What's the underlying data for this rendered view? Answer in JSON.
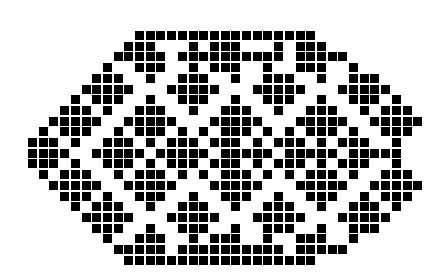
{
  "figure": {
    "colors": {
      "filled": "#000000",
      "background": "#ffffff"
    },
    "cell_pitch_px": 10.7,
    "cell_size_px": 9,
    "rows": [
      "..........#################..........",
      ".........###...#.###...#.###.........",
      "........#####.##########.#####.......",
      ".......#..###..#.###..#..###..#......",
      "......###..#..###..#..###..#..###....",
      ".....#####...#####...#####...#####...",
      "....#.###..#..###..#..###..#..###.#..",
      "...###.#..###..#..###..#..###..#.###.",
      "..#####..#####...#####...#####..#####",
      ".#.###..#.###.#.#.###.#.#.###.#..###.",
      "###.#..###.#.###.###.#.###.#.###..#..",
      "####..#####.#####.#####.#####.#####..",
      "###.#..###.#.###.###.#.###.#.###..#..",
      ".#.###..#.###.#.#.###.#.#.###.#..###.",
      "..#####..#####...#####...#####..#####",
      "...###.#..###..#..###..#..###..#.###.",
      "....#.###..#..###..#..###..#..###.#..",
      ".....#####...#####...#####...#####...",
      "......###..#..###..#..###..#..###....",
      ".......#..###..#.###..#..###..#......",
      "........#####.##########.#####.......",
      ".........##################.........."
    ]
  }
}
